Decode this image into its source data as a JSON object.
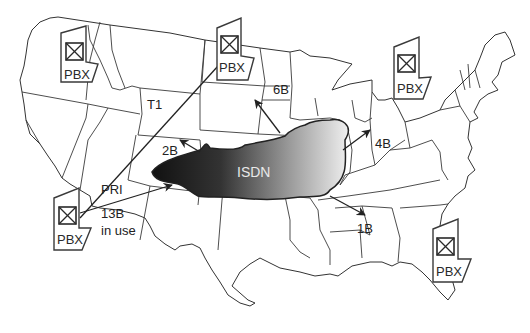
{
  "diagram": {
    "cloud": {
      "label": "ISDN",
      "gradient_dark": "#1a1a1a",
      "gradient_light": "#f0f0f0"
    },
    "pbx_sites": [
      {
        "id": "pbx-pacific-northwest",
        "label": "PBX"
      },
      {
        "id": "pbx-north-dakota",
        "label": "PBX"
      },
      {
        "id": "pbx-great-lakes",
        "label": "PBX"
      },
      {
        "id": "pbx-california",
        "label": "PBX"
      },
      {
        "id": "pbx-southeast",
        "label": "PBX"
      }
    ],
    "links": [
      {
        "id": "t1",
        "label": "T1",
        "type": "line"
      },
      {
        "id": "pri",
        "label": "PRI",
        "type": "arrow"
      },
      {
        "id": "in-use",
        "label_line1": "13B",
        "label_line2": "in use"
      },
      {
        "id": "b2",
        "label": "2B",
        "type": "arrow"
      },
      {
        "id": "b6",
        "label": "6B",
        "type": "arrow"
      },
      {
        "id": "b4",
        "label": "4B",
        "type": "arrow"
      },
      {
        "id": "b1",
        "label": "1B",
        "type": "arrow"
      }
    ],
    "colors": {
      "stroke": "#3a3a3a",
      "background": "#ffffff"
    }
  }
}
